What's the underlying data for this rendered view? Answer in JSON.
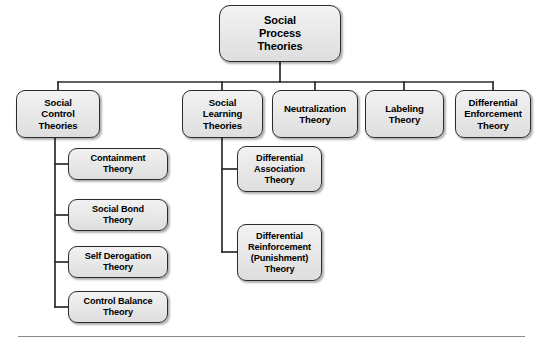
{
  "diagram": {
    "type": "organizational-tree",
    "title": "Social Process Theories",
    "background_color": "#ffffff",
    "node_fill_color": "#e9e9e9",
    "node_border_color": "#2b2b2b",
    "connector_color": "#2b2b2b",
    "rule_color": "#8a8a8a"
  },
  "root": {
    "label": "Social\nProcess\nTheories"
  },
  "level2": [
    {
      "label": "Social\nControl\nTheories"
    },
    {
      "label": "Social\nLearning\nTheories"
    },
    {
      "label": "Neutralization\nTheory"
    },
    {
      "label": "Labeling\nTheory"
    },
    {
      "label": "Differential\nEnforcement\nTheory"
    }
  ],
  "social_control_children": [
    {
      "label": "Containment\nTheory"
    },
    {
      "label": "Social Bond\nTheory"
    },
    {
      "label": "Self Derogation\nTheory"
    },
    {
      "label": "Control Balance\nTheory"
    }
  ],
  "social_learning_children": [
    {
      "label": "Differential\nAssociation\nTheory"
    },
    {
      "label": "Differential\nReinforcement\n(Punishment)\nTheory"
    }
  ],
  "footer": {
    "rule_visible": "true"
  }
}
